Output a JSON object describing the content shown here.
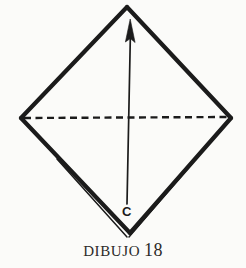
{
  "figure": {
    "caption_word": "DIBUJO",
    "caption_number": "18",
    "caption_full": "DIBUJO 18",
    "vertex_label_c": "C",
    "ink_color": "#1b1b1b",
    "paper_color": "#fbfbf9",
    "shape_name": "diamond-square-folded",
    "icons": {
      "arrow": "up-arrow-icon",
      "fold_line": "dashed-fold-line-icon",
      "crease": "double-crease-line-icon"
    },
    "geometry": {
      "top_vertex": [
        127,
        6
      ],
      "right_vertex": [
        232,
        118
      ],
      "bottom_vertex": [
        130,
        234
      ],
      "left_vertex": [
        20,
        118
      ],
      "arrow_tail": [
        127,
        204
      ],
      "arrow_tip": [
        130,
        19
      ],
      "dashed_line_from": [
        24,
        118
      ],
      "dashed_line_to": [
        228,
        117
      ]
    }
  }
}
